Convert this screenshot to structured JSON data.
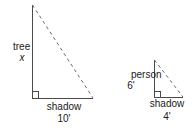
{
  "figure": {
    "type": "similar-right-triangles-shadow-problem",
    "stroke_color": "#4a4a4a",
    "text_color": "#1a1a1a",
    "background_color": "#ffffff",
    "tree_triangle": {
      "vertical_label": "tree",
      "vertical_value": "x",
      "base_label": "shadow",
      "base_value": "10'",
      "apex": {
        "x": 32,
        "y": 5
      },
      "right_angle_vertex": {
        "x": 32,
        "y": 98
      },
      "base_end": {
        "x": 93,
        "y": 98
      },
      "hypotenuse_style": "dashed",
      "right_angle_marker": true
    },
    "person_triangle": {
      "vertical_label": "person",
      "vertical_value": "6'",
      "base_label": "shadow",
      "base_value": "4'",
      "apex": {
        "x": 154,
        "y": 60
      },
      "right_angle_vertex": {
        "x": 154,
        "y": 97
      },
      "base_end": {
        "x": 183,
        "y": 97
      },
      "hypotenuse_style": "dashed",
      "right_angle_marker": true
    }
  }
}
